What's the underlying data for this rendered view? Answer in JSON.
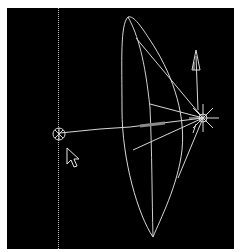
{
  "viewport": {
    "name": "3D viewport - spotlight gizmo",
    "background": "#000000",
    "line_color": "#d8d8d8"
  },
  "objects": {
    "light_source": {
      "label": "spotlight",
      "icon": "sun-star-icon"
    },
    "target_handle": {
      "label": "target",
      "icon": "circle-target-icon"
    },
    "direction_arrow": {
      "label": "up-vector",
      "icon": "arrow-up-icon"
    },
    "cone": {
      "label": "light cone"
    },
    "guide_line": {
      "label": "vertical guide"
    }
  },
  "cursor": {
    "icon": "mouse-pointer-icon"
  }
}
